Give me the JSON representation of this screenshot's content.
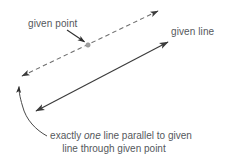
{
  "figure": {
    "kind": "geometry-diagram",
    "topic": "parallel-postulate",
    "background_color": "#ffffff",
    "ink_color": "#3b3b3b",
    "text_color": "#55585c",
    "point_color": "#9b9b9b",
    "width": 228,
    "height": 164
  },
  "labels": {
    "given_point": "given point",
    "given_line": "given line"
  },
  "caption": {
    "line1_part1": "exactly ",
    "line1_emph": "one",
    "line1_part2": " line parallel to given",
    "line2": "line through given point"
  },
  "elements": {
    "dashed_line_name": "parallel-line-dashed",
    "solid_line_name": "given-line-solid",
    "point_name": "given-point-dot",
    "pointer_name": "given-point-pointer",
    "curve_name": "caption-curved-pointer"
  },
  "geometry": {
    "dashed_line": {
      "x1": 22,
      "y1": 76,
      "x2": 158,
      "y2": 11
    },
    "solid_line": {
      "x1": 36,
      "y1": 111,
      "x2": 168,
      "y2": 42
    },
    "given_point": {
      "cx": 88,
      "cy": 45,
      "r": 2.2
    },
    "pointer": {
      "x1": 67,
      "y1": 30,
      "x2": 85,
      "y2": 42
    },
    "curve": {
      "start_x": 47,
      "start_y": 136,
      "end_x": 19,
      "end_y": 84
    }
  }
}
